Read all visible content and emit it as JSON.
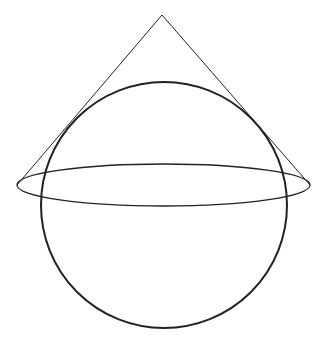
{
  "diagram": {
    "background": "#ffffff",
    "stroke_color": "#222222",
    "cone": {
      "apex": [
        162,
        15
      ],
      "base_left": [
        17,
        185
      ],
      "base_right": [
        310,
        185
      ],
      "stroke_width": 1
    },
    "ellipse": {
      "cx": 163.5,
      "cy": 185,
      "rx": 146.5,
      "ry": 21,
      "stroke_width": 1.3
    },
    "sphere": {
      "cx": 164,
      "cy": 205,
      "r": 123,
      "stroke_width": 2
    }
  }
}
